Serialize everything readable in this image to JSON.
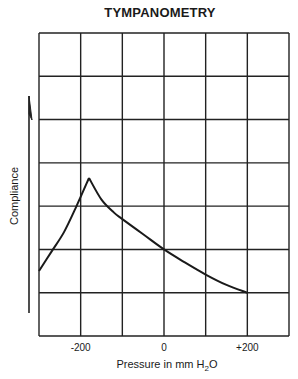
{
  "chart_data": {
    "type": "line",
    "title": "TYMPANOMETRY",
    "xlabel": "Pressure in mm H2O",
    "xlabel_main": "Pressure in mm H",
    "xlabel_sub": "2",
    "xlabel_end": "O",
    "ylabel": "Compliance",
    "xlim": [
      -300,
      300
    ],
    "ylim": [
      0,
      7
    ],
    "x_ticks": [
      {
        "value": -200,
        "label": "-200"
      },
      {
        "value": 0,
        "label": "0"
      },
      {
        "value": 200,
        "label": "+200"
      }
    ],
    "grid": {
      "on": true,
      "columns": 6,
      "rows": 7
    },
    "y_units": "grid units (unlabeled)",
    "series": [
      {
        "name": "Tympanogram",
        "x": [
          -300,
          -270,
          -240,
          -210,
          -180,
          -150,
          -120,
          -100,
          -50,
          0,
          50,
          100,
          150,
          200
        ],
        "y": [
          1.5,
          1.95,
          2.4,
          3.0,
          3.65,
          3.15,
          2.85,
          2.7,
          2.35,
          2.0,
          1.7,
          1.42,
          1.18,
          1.0
        ]
      }
    ],
    "legend": null,
    "annotations": [
      "Upward arrow along y-axis indicating increasing compliance"
    ]
  }
}
